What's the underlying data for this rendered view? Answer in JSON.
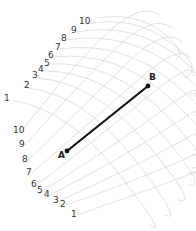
{
  "diagram": {
    "type": "warped-grid-geodesic",
    "grid_color": "#d9d9d9",
    "line_color": "#111111",
    "upper_axis": {
      "labels": [
        "1",
        "2",
        "3",
        "4",
        "5",
        "6",
        "7",
        "8",
        "9",
        "10"
      ]
    },
    "lower_axis": {
      "labels": [
        "1",
        "2",
        "3",
        "4",
        "5",
        "6",
        "7",
        "8",
        "9",
        "10"
      ]
    },
    "points": [
      {
        "name": "A",
        "label": "A"
      },
      {
        "name": "B",
        "label": "B"
      }
    ],
    "segment": {
      "from": "A",
      "to": "B"
    }
  }
}
